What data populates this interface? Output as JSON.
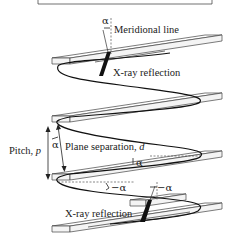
{
  "diagram": {
    "labels": {
      "meridional_line": "Meridional line",
      "xray_reflection_top": "X-ray reflection",
      "xray_reflection_bottom": "X-ray reflection",
      "pitch_prefix": "Pitch, ",
      "pitch_symbol": "p",
      "plane_sep_prefix": "Plane separation, ",
      "plane_sep_symbol": "d",
      "alpha_top": "α",
      "alpha_pitch": "α",
      "alpha_mid": "α",
      "neg_alpha_left": "−α",
      "neg_alpha_right": "−α"
    },
    "colors": {
      "line": "#111111",
      "plate_edge": "#444444",
      "background": "#ffffff"
    }
  }
}
